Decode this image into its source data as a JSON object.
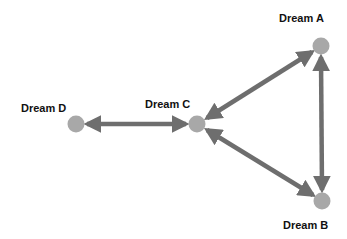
{
  "diagram": {
    "nodes": [
      {
        "id": "A",
        "label": "Dream A",
        "x": 321,
        "y": 46
      },
      {
        "id": "B",
        "label": "Dream B",
        "x": 322,
        "y": 201
      },
      {
        "id": "C",
        "label": "Dream C",
        "x": 197,
        "y": 124
      },
      {
        "id": "D",
        "label": "Dream D",
        "x": 76,
        "y": 124
      }
    ],
    "edges": [
      {
        "from": "A",
        "to": "C",
        "bidirectional": true
      },
      {
        "from": "A",
        "to": "B",
        "bidirectional": true
      },
      {
        "from": "B",
        "to": "C",
        "bidirectional": true
      },
      {
        "from": "C",
        "to": "D",
        "bidirectional": true
      }
    ],
    "colors": {
      "node_fill": "#a8a8a8",
      "edge": "#6e6e6e",
      "label": "#111111"
    }
  }
}
